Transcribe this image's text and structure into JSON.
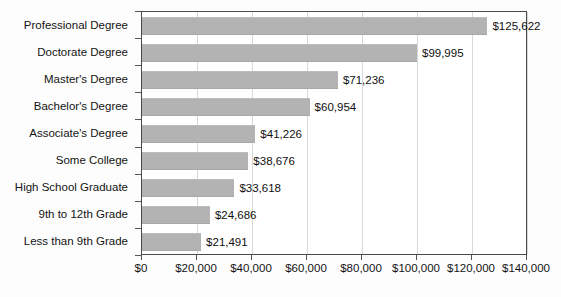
{
  "chart_data": {
    "type": "bar",
    "orientation": "horizontal",
    "title": "",
    "subtitle": "",
    "xlabel": "",
    "ylabel": "",
    "xlim": [
      0,
      140000
    ],
    "ylim": null,
    "grid": true,
    "legend": null,
    "xtick_labels": [
      "$0",
      "$20,000",
      "$40,000",
      "$60,000",
      "$80,000",
      "$100,000",
      "$120,000",
      "$140,000"
    ],
    "xtick_values": [
      0,
      20000,
      40000,
      60000,
      80000,
      100000,
      120000,
      140000
    ],
    "categories": [
      "Professional Degree",
      "Doctorate Degree",
      "Master's Degree",
      "Bachelor's Degree",
      "Associate's Degree",
      "Some College",
      "High School Graduate",
      "9th to 12th Grade",
      "Less than 9th Grade"
    ],
    "values": [
      125622,
      99995,
      71236,
      60954,
      41226,
      38676,
      33618,
      24686,
      21491
    ],
    "value_labels": [
      "$125,622",
      "$99,995",
      "$71,236",
      "$60,954",
      "$41,226",
      "$38,676",
      "$33,618",
      "$24,686",
      "$21,491"
    ],
    "bar_color": "#b3b3b3",
    "grid_color": "#d8d8d8",
    "axis_color": "#4a4a4a",
    "background_color": "#ffffff"
  }
}
